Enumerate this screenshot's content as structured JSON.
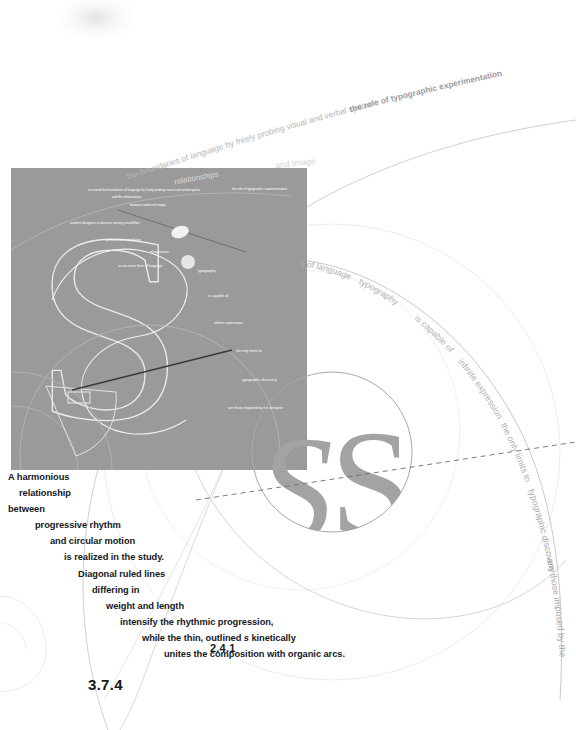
{
  "page": {
    "figure_number": "2.4.1",
    "folio": "3.7.4"
  },
  "caption": {
    "lines": [
      "A harmonious",
      "relationship",
      "between",
      "progressive rhythm",
      "and circular motion",
      "is realized in the study.",
      "Diagonal ruled lines",
      "differing in",
      "weight and length",
      "intensify the rhythmic progression,",
      "while the thin, outlined s kinetically",
      "unites the composition with organic arcs."
    ],
    "italic_word": "s"
  },
  "arc_outer": {
    "segments": [
      "the boundaries of language by freely probing visual and verbal syntax",
      "the role of typographic experimentation"
    ],
    "full": "to extend the boundaries of language by freely probing visual and verbal syntax the role of typographic experimentation"
  },
  "arc_secondary": {
    "segments": [
      "relationships",
      "and image"
    ]
  },
  "arc_right": {
    "segments": [
      "s of language",
      "typography",
      "is capable of",
      "infinite expression",
      "the only limits to",
      "typographic discovery",
      "are those imposed by the designer"
    ]
  },
  "panel": {
    "lines": [
      "to extend the boundaries of language by freely probing visual and verbal syntax",
      "the role of typographic experimentation",
      "and the relationships",
      "between word and image",
      "enables designers to discover among possibilities",
      "an enormous vocabulary",
      "of expression",
      "as an active form of language",
      "typography",
      "is capable of",
      "infinite expression",
      "the only limits to",
      "typographic discovery",
      "are those imposed by the designer"
    ],
    "letterform": "S"
  },
  "circle_motif": {
    "letterform": "S"
  },
  "colors": {
    "panel_gray": "#9a9a9a",
    "letter_gray": "#a0a0a0",
    "text_dark": "#15181c",
    "arc_line": "#b9b9b9",
    "faint": "#d8d8d8"
  }
}
